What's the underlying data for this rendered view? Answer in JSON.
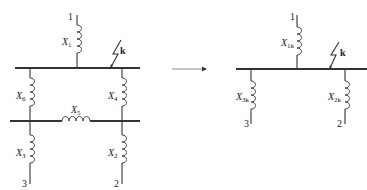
{
  "left_diagram": {
    "source_top": "1",
    "fault_label": "k",
    "reactances": {
      "x1": {
        "symbol": "X",
        "sub": "1"
      },
      "x2": {
        "symbol": "X",
        "sub": "2"
      },
      "x3": {
        "symbol": "X",
        "sub": "3"
      },
      "x4": {
        "symbol": "X",
        "sub": "4"
      },
      "x5": {
        "symbol": "X",
        "sub": "5"
      },
      "x6": {
        "symbol": "X",
        "sub": "6"
      }
    },
    "terminal_left": "3",
    "terminal_right": "2"
  },
  "arrow": {
    "direction": "right"
  },
  "right_diagram": {
    "source_top": "1",
    "fault_label": "k",
    "reactances": {
      "x1k": {
        "symbol": "X",
        "sub": "1k"
      },
      "x2k": {
        "symbol": "X",
        "sub": "2k"
      },
      "x3k": {
        "symbol": "X",
        "sub": "3k"
      }
    },
    "terminal_left": "3",
    "terminal_right": "2"
  }
}
